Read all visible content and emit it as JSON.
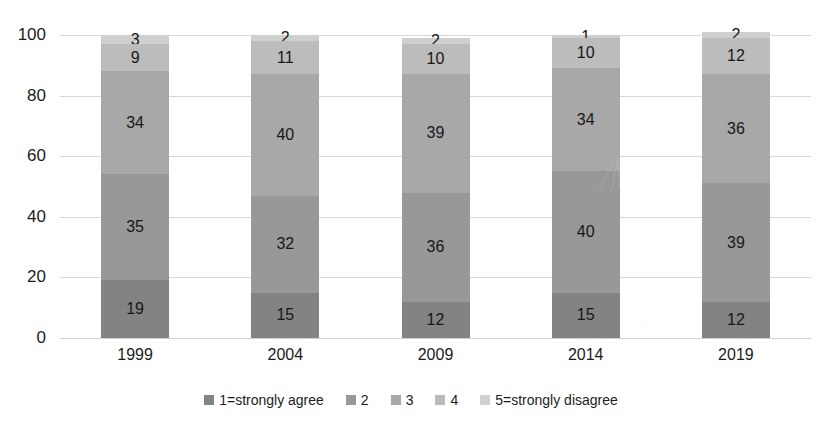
{
  "chart_data": {
    "type": "bar",
    "subtype": "stacked-bar-100",
    "title": "",
    "xlabel": "",
    "ylabel": "",
    "ylim": [
      0,
      100
    ],
    "yticks": [
      0,
      20,
      40,
      60,
      80,
      100
    ],
    "grid": true,
    "legend_position": "bottom",
    "categories": [
      "1999",
      "2004",
      "2009",
      "2014",
      "2019"
    ],
    "series": [
      {
        "name": "1=strongly agree",
        "color": "#838383",
        "values": [
          19,
          15,
          12,
          15,
          12
        ]
      },
      {
        "name": "2",
        "color": "#989898",
        "values": [
          35,
          32,
          36,
          40,
          39
        ]
      },
      {
        "name": "3",
        "color": "#a8a8a8",
        "values": [
          34,
          40,
          39,
          34,
          36
        ]
      },
      {
        "name": "4",
        "color": "#bcbcbc",
        "values": [
          9,
          11,
          10,
          10,
          12
        ]
      },
      {
        "name": "5=strongly disagree",
        "color": "#cfcfcf",
        "values": [
          3,
          2,
          2,
          1,
          2
        ]
      }
    ]
  },
  "axis": {
    "y_ticks": [
      "100",
      "80",
      "60",
      "40",
      "20",
      "0"
    ],
    "x_ticks": [
      "1999",
      "2004",
      "2009",
      "2014",
      "2019"
    ]
  },
  "legend": {
    "items": [
      {
        "label": "1=strongly agree",
        "color": "#838383"
      },
      {
        "label": "2",
        "color": "#989898"
      },
      {
        "label": "3",
        "color": "#a8a8a8"
      },
      {
        "label": "4",
        "color": "#bcbcbc"
      },
      {
        "label": "5=strongly disagree",
        "color": "#cfcfcf"
      }
    ]
  },
  "bars": [
    {
      "category": "1999",
      "labels": [
        "19",
        "35",
        "34",
        "9",
        "3"
      ]
    },
    {
      "category": "2004",
      "labels": [
        "15",
        "32",
        "40",
        "11",
        "2"
      ]
    },
    {
      "category": "2009",
      "labels": [
        "12",
        "36",
        "39",
        "10",
        "2"
      ]
    },
    {
      "category": "2014",
      "labels": [
        "15",
        "40",
        "34",
        "10",
        "1"
      ]
    },
    {
      "category": "2019",
      "labels": [
        "12",
        "39",
        "36",
        "12",
        "2"
      ]
    }
  ],
  "title_strip": ""
}
